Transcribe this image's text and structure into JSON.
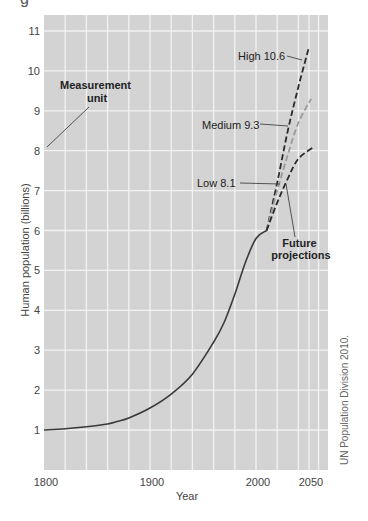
{
  "chart_data": {
    "type": "line",
    "title": "",
    "cropped_title_fragment": "g",
    "xlabel": "Year",
    "ylabel": "Human population (billions)",
    "xlim": [
      1800,
      2067
    ],
    "ylim": [
      0,
      11.4
    ],
    "grid": true,
    "x_ticks": [
      1800,
      1900,
      2000,
      2050
    ],
    "y_ticks": [
      1,
      2,
      3,
      4,
      5,
      6,
      7,
      8,
      9,
      10,
      11
    ],
    "series": [
      {
        "name": "Historical",
        "style": "solid",
        "color": "#3a3a3a",
        "x": [
          1800,
          1820,
          1840,
          1860,
          1870,
          1880,
          1900,
          1920,
          1940,
          1960,
          1970,
          1980,
          1990,
          2000,
          2010
        ],
        "values": [
          1.0,
          1.03,
          1.08,
          1.15,
          1.22,
          1.3,
          1.55,
          1.9,
          2.4,
          3.2,
          3.7,
          4.4,
          5.2,
          5.8,
          6.0
        ]
      },
      {
        "name": "High 10.6",
        "style": "dashed",
        "color": "#2a2a2a",
        "x": [
          2010,
          2020,
          2030,
          2040,
          2050
        ],
        "values": [
          6.0,
          7.2,
          8.5,
          9.6,
          10.6
        ]
      },
      {
        "name": "Medium 9.3",
        "style": "dashed",
        "color": "#9a9a9a",
        "x": [
          2010,
          2020,
          2030,
          2040,
          2052
        ],
        "values": [
          6.0,
          7.0,
          7.9,
          8.7,
          9.3
        ]
      },
      {
        "name": "Low 8.1",
        "style": "dashed",
        "color": "#2a2a2a",
        "x": [
          2010,
          2020,
          2030,
          2040,
          2055
        ],
        "values": [
          6.0,
          6.7,
          7.3,
          7.8,
          8.1
        ]
      }
    ],
    "annotations": [
      {
        "text": [
          "Measurement",
          "unit"
        ],
        "bold": true,
        "points_to": "y-axis tick 8"
      },
      {
        "text": [
          "High 10.6"
        ],
        "bold": false,
        "points_to": "High projection"
      },
      {
        "text": [
          "Medium 9.3"
        ],
        "bold": false,
        "points_to": "Medium projection"
      },
      {
        "text": [
          "Low 8.1"
        ],
        "bold": false,
        "points_to": "Low projection"
      },
      {
        "text": [
          "Future",
          "projections"
        ],
        "bold": true,
        "points_to": "projection curves"
      }
    ],
    "source": "UN Population Division 2010."
  },
  "colors": {
    "plot_background": "#d3d3d3",
    "grid": "#f2f2f2",
    "curve": "#3a3a3a",
    "medium_curve": "#9a9a9a"
  }
}
